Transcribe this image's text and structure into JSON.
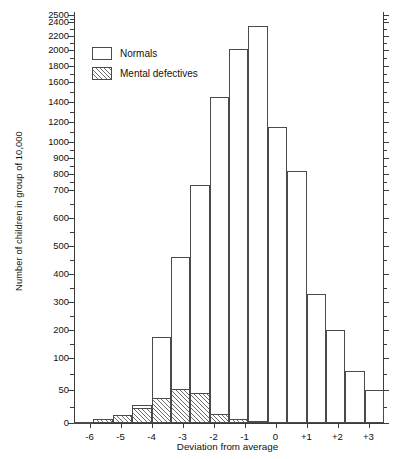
{
  "chart_data": {
    "type": "bar",
    "title": "",
    "xlabel": "Deviation from average",
    "ylabel": "Number of children in group of 10,000",
    "grid": false,
    "legend_position": "top-left",
    "x_ticks": [
      "-6",
      "-5",
      "-4",
      "-3",
      "-2",
      "-1",
      "0",
      "+1",
      "+2",
      "+3"
    ],
    "x_tick_values": [
      -6,
      -5,
      -4,
      -3,
      -2,
      -1,
      0,
      1,
      2,
      3
    ],
    "xlim": [
      -6.5,
      3.5
    ],
    "y_ticks": [
      "0",
      "50",
      "100",
      "200",
      "300",
      "400",
      "500",
      "600",
      "700",
      "800",
      "900",
      "1000",
      "1200",
      "1400",
      "1600",
      "1800",
      "2000",
      "2200",
      "2400",
      "2500"
    ],
    "y_tick_values": [
      0,
      50,
      100,
      200,
      300,
      400,
      500,
      600,
      700,
      800,
      900,
      1000,
      1200,
      1400,
      1600,
      1800,
      2000,
      2200,
      2400,
      2500
    ],
    "y_axis_note": "non-linear compressed scale",
    "ylim": [
      0,
      2500
    ],
    "categories": [
      -6,
      -5,
      -4,
      -3,
      -2,
      -1,
      0,
      1,
      2,
      3
    ],
    "series": [
      {
        "name": "Normals",
        "fill": "white",
        "values": [
          1,
          4,
          12,
          28,
          175,
          730,
          2010,
          2350,
          1150,
          820
        ]
      },
      {
        "name": "Mental defectives",
        "fill": "hatched",
        "values": [
          2,
          11,
          30,
          52,
          42,
          14,
          5,
          3,
          0,
          0
        ]
      }
    ],
    "tail_bars_right": {
      "categories": [
        2.5,
        3.5
      ],
      "values": [
        330,
        200
      ]
    },
    "all_normals_bars": [
      {
        "x": -6,
        "value": 1
      },
      {
        "x": -5,
        "value": 4
      },
      {
        "x": -4,
        "value": 12
      },
      {
        "x": -3,
        "value": 28
      },
      {
        "x": -2,
        "value": 175
      },
      {
        "x": -1,
        "value": 460
      },
      {
        "x": 0,
        "value": 730
      },
      {
        "x": 1,
        "value": 1450
      },
      {
        "x": 2,
        "value": 2010
      },
      {
        "x": 3,
        "value": 2350
      },
      {
        "x": 4,
        "value": 1150
      },
      {
        "x": 5,
        "value": 820
      },
      {
        "x": 6,
        "value": 330
      },
      {
        "x": 7,
        "value": 200
      },
      {
        "x": 8,
        "value": 80
      },
      {
        "x": 9,
        "value": 50
      }
    ]
  },
  "legend": {
    "items": [
      {
        "label": "Normals",
        "style": "white"
      },
      {
        "label": "Mental defectives",
        "style": "hatched"
      }
    ]
  },
  "axes": {
    "y_title": "Number of children in group of 10,000",
    "x_title": "Deviation from average"
  },
  "y_tick_labels": [
    "2500",
    "2400",
    "2200",
    "2000",
    "1800",
    "1600",
    "1400",
    "1200",
    "1000",
    "900",
    "800",
    "700",
    "600",
    "500",
    "400",
    "300",
    "200",
    "100",
    "50",
    "0"
  ],
  "x_tick_labels": [
    "-6",
    "-5",
    "-4",
    "-3",
    "-2",
    "-1",
    "0",
    "+1",
    "+2",
    "+3"
  ]
}
